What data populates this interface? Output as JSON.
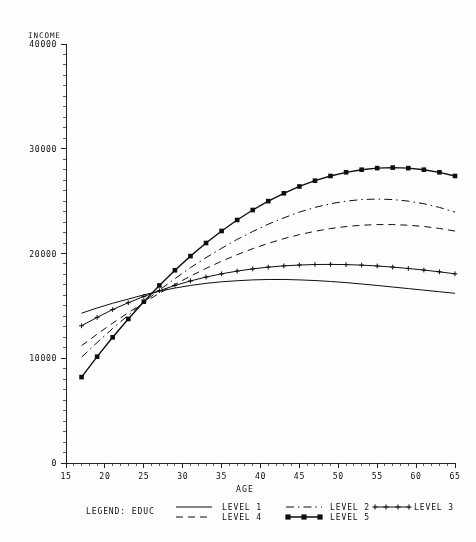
{
  "chart_data": {
    "type": "line",
    "title": "",
    "corner_label": "INCOME",
    "xlabel": "AGE",
    "ylabel": "INCOME",
    "xlim": [
      15,
      65
    ],
    "ylim": [
      0,
      40000
    ],
    "xticks": [
      15,
      20,
      25,
      30,
      35,
      40,
      45,
      50,
      55,
      60,
      65
    ],
    "yticks": [
      0,
      10000,
      20000,
      30000,
      40000
    ],
    "xtick_labels": [
      "15",
      "20",
      "25",
      "30",
      "35",
      "40",
      "45",
      "50",
      "55",
      "60",
      "65"
    ],
    "ytick_labels": [
      "0",
      "10000",
      "20000",
      "30000",
      "40000"
    ],
    "grid": false,
    "legend_position": "bottom",
    "legend_title": "LEGEND: EDUC",
    "x": [
      17,
      19,
      21,
      23,
      25,
      27,
      29,
      31,
      33,
      35,
      37,
      39,
      41,
      43,
      45,
      47,
      49,
      51,
      53,
      55,
      57,
      59,
      61,
      63,
      65
    ],
    "series": [
      {
        "name": "LEVEL 1",
        "label": "LEVEL 1",
        "style": "solid",
        "marker": "none",
        "values": [
          14300,
          14800,
          15250,
          15650,
          16050,
          16400,
          16700,
          16950,
          17150,
          17300,
          17400,
          17480,
          17520,
          17520,
          17480,
          17420,
          17330,
          17220,
          17090,
          16950,
          16800,
          16650,
          16500,
          16350,
          16200
        ]
      },
      {
        "name": "LEVEL 2",
        "label": "LEVEL 2",
        "style": "dashdot",
        "marker": "none",
        "values": [
          10100,
          11500,
          12850,
          14100,
          15350,
          16500,
          17600,
          18650,
          19600,
          20500,
          21350,
          22100,
          22800,
          23400,
          23950,
          24400,
          24750,
          25000,
          25150,
          25200,
          25150,
          25000,
          24750,
          24400,
          23950
        ]
      },
      {
        "name": "LEVEL 3",
        "label": "LEVEL 3",
        "style": "solid",
        "marker": "plus",
        "values": [
          13100,
          13900,
          14650,
          15300,
          15900,
          16450,
          16950,
          17380,
          17750,
          18060,
          18320,
          18530,
          18700,
          18820,
          18900,
          18950,
          18960,
          18940,
          18890,
          18810,
          18700,
          18570,
          18420,
          18250,
          18060
        ]
      },
      {
        "name": "LEVEL 4",
        "label": "LEVEL 4",
        "style": "dashed",
        "marker": "none",
        "values": [
          11200,
          12300,
          13350,
          14350,
          15300,
          16200,
          17050,
          17840,
          18580,
          19260,
          19890,
          20460,
          20970,
          21420,
          21800,
          22120,
          22380,
          22570,
          22700,
          22760,
          22760,
          22700,
          22580,
          22390,
          22140
        ]
      },
      {
        "name": "LEVEL 5",
        "label": "LEVEL 5",
        "style": "solid",
        "marker": "square",
        "values": [
          8200,
          10150,
          12000,
          13750,
          15400,
          16950,
          18400,
          19750,
          21000,
          22150,
          23200,
          24150,
          25000,
          25750,
          26400,
          26950,
          27400,
          27750,
          28000,
          28150,
          28200,
          28150,
          28000,
          27750,
          27400
        ]
      }
    ]
  },
  "legend": {
    "title": "LEGEND: EDUC",
    "entries": [
      {
        "label": "LEVEL 1",
        "style": "solid",
        "marker": "none"
      },
      {
        "label": "LEVEL 2",
        "style": "dashdot",
        "marker": "none"
      },
      {
        "label": "LEVEL 3",
        "style": "solid",
        "marker": "plus"
      },
      {
        "label": "LEVEL 4",
        "style": "dashed",
        "marker": "none"
      },
      {
        "label": "LEVEL 5",
        "style": "solid",
        "marker": "square"
      }
    ]
  }
}
